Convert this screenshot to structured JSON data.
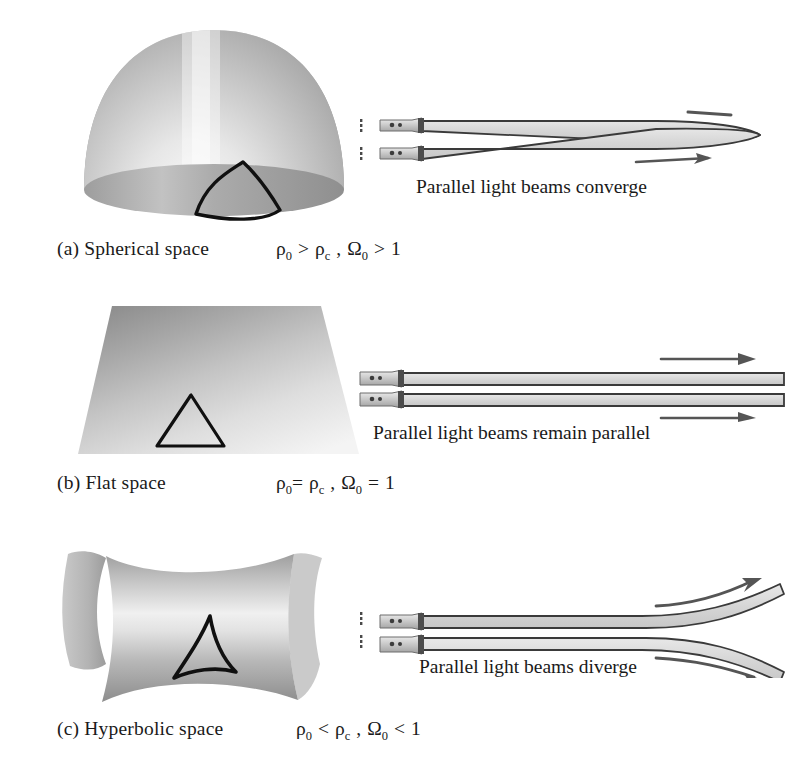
{
  "figure": {
    "type": "diagram",
    "panels": [
      {
        "id": "a",
        "tag": "(a)",
        "name": "Spherical space",
        "label": "(a)  Spherical space",
        "formula": {
          "full": "ρ₀ > ρᴄ , Ω₀ > 1",
          "density_symbol": "ρ",
          "density_sub": "0",
          "comparator_density": ">",
          "critical_symbol": "ρ",
          "critical_sub": "c",
          "omega_symbol": "Ω",
          "omega_sub": "0",
          "comparator_omega": ">",
          "omega_value": "1"
        },
        "surface": "dome",
        "triangle": "bulging-triangle",
        "beam_caption": "Parallel light beams converge",
        "beam_behavior": "converge"
      },
      {
        "id": "b",
        "tag": "(b)",
        "name": "Flat space",
        "label": "(b)  Flat space",
        "formula": {
          "full": "ρ₀ = ρᴄ , Ω₀ = 1",
          "density_symbol": "ρ",
          "density_sub": "0",
          "comparator_density": "=",
          "critical_symbol": "ρ",
          "critical_sub": "c",
          "omega_symbol": "Ω",
          "omega_sub": "0",
          "comparator_omega": "=",
          "omega_value": "1"
        },
        "surface": "plane",
        "triangle": "straight-triangle",
        "beam_caption": "Parallel light beams remain parallel",
        "beam_behavior": "parallel"
      },
      {
        "id": "c",
        "tag": "(c)",
        "name": "Hyperbolic space",
        "label": "(c)  Hyperbolic space",
        "formula": {
          "full": "ρ₀ < ρᴄ , Ω₀ < 1",
          "density_symbol": "ρ",
          "density_sub": "0",
          "comparator_density": "<",
          "critical_symbol": "ρ",
          "critical_sub": "c",
          "omega_symbol": "Ω",
          "omega_sub": "0",
          "comparator_omega": "<",
          "omega_value": "1"
        },
        "surface": "saddle",
        "triangle": "concave-triangle",
        "beam_caption": "Parallel light beams diverge",
        "beam_behavior": "diverge"
      }
    ],
    "colors": {
      "background": "#ffffff",
      "text": "#1a1a1a",
      "surface_dark": "#8d8d8d",
      "surface_mid": "#b4b4b4",
      "surface_light": "#f2f2f2",
      "triangle_stroke": "#101010",
      "beam_fill": "#d9d9d9",
      "beam_stroke": "#3a3a3a",
      "arrow": "#555555",
      "emitter_body": "#c9c9c9"
    },
    "beam_count_per_panel": 2,
    "emitter_name": "flashlight"
  }
}
